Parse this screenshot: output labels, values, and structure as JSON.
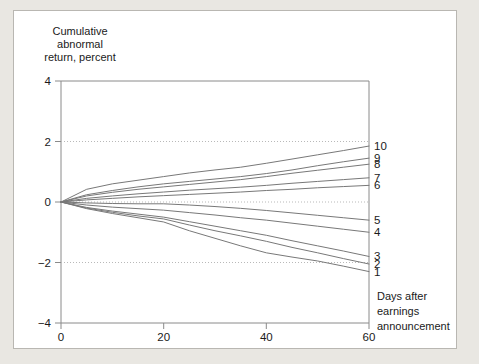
{
  "figure": {
    "background_color": "#ffffff",
    "page_background_color": "#e9e7e2",
    "border_color": "#b9b7b2"
  },
  "chart_data": {
    "type": "line",
    "title": "",
    "ylabel_lines": [
      "Cumulative",
      "abnormal",
      "return, percent"
    ],
    "ylabel": "Cumulative abnormal return, percent",
    "xlabel_lines": [
      "Days after",
      "earnings",
      "announcement"
    ],
    "xlabel": "Days after earnings announcement",
    "xlim": [
      0,
      60
    ],
    "ylim": [
      -4,
      4
    ],
    "xticks": [
      0,
      20,
      40,
      60
    ],
    "xtick_labels": [
      "0",
      "20",
      "40",
      "60"
    ],
    "yticks": [
      4,
      2,
      0,
      -2,
      -4
    ],
    "ytick_labels": [
      "4",
      "2",
      "0",
      "−2",
      "−4"
    ],
    "grid": "horizontal dotted at y = 2, 0, -2",
    "gridlines_y": [
      2,
      0,
      -2
    ],
    "legend_position": "right-of-axes, one label per series at line end",
    "line_color": "#787878",
    "x": [
      0,
      5,
      10,
      15,
      20,
      25,
      30,
      35,
      40,
      45,
      50,
      55,
      60
    ],
    "series": [
      {
        "name": "10",
        "label": "10",
        "end_value": 1.85,
        "values": [
          0,
          0.42,
          0.6,
          0.72,
          0.84,
          0.96,
          1.06,
          1.15,
          1.28,
          1.42,
          1.56,
          1.7,
          1.85
        ]
      },
      {
        "name": "9",
        "label": "9",
        "end_value": 1.45,
        "values": [
          0,
          0.24,
          0.38,
          0.5,
          0.6,
          0.68,
          0.76,
          0.84,
          0.94,
          1.06,
          1.2,
          1.33,
          1.45
        ]
      },
      {
        "name": "8",
        "label": "8",
        "end_value": 1.25,
        "values": [
          0,
          0.2,
          0.32,
          0.42,
          0.5,
          0.58,
          0.66,
          0.74,
          0.84,
          0.95,
          1.05,
          1.15,
          1.25
        ]
      },
      {
        "name": "7",
        "label": "7",
        "end_value": 0.8,
        "values": [
          0,
          0.12,
          0.2,
          0.27,
          0.33,
          0.39,
          0.44,
          0.49,
          0.55,
          0.62,
          0.68,
          0.74,
          0.8
        ]
      },
      {
        "name": "6",
        "label": "6",
        "end_value": 0.55,
        "values": [
          0,
          0.07,
          0.12,
          0.17,
          0.21,
          0.25,
          0.29,
          0.33,
          0.38,
          0.42,
          0.47,
          0.51,
          0.55
        ]
      },
      {
        "name": "5",
        "label": "5",
        "end_value": -0.6,
        "values": [
          0,
          -0.03,
          -0.05,
          -0.06,
          -0.06,
          -0.1,
          -0.15,
          -0.21,
          -0.28,
          -0.36,
          -0.44,
          -0.52,
          -0.6
        ]
      },
      {
        "name": "4",
        "label": "4",
        "end_value": -1.0,
        "values": [
          0,
          -0.1,
          -0.17,
          -0.22,
          -0.27,
          -0.35,
          -0.43,
          -0.52,
          -0.6,
          -0.7,
          -0.8,
          -0.9,
          -1.0
        ]
      },
      {
        "name": "3",
        "label": "3",
        "end_value": -1.8,
        "values": [
          0,
          -0.18,
          -0.3,
          -0.4,
          -0.5,
          -0.65,
          -0.8,
          -0.95,
          -1.1,
          -1.28,
          -1.45,
          -1.62,
          -1.8
        ]
      },
      {
        "name": "2",
        "label": "2",
        "end_value": -2.05,
        "values": [
          0,
          -0.2,
          -0.34,
          -0.46,
          -0.56,
          -0.76,
          -0.95,
          -1.12,
          -1.3,
          -1.5,
          -1.68,
          -1.87,
          -2.05
        ]
      },
      {
        "name": "1",
        "label": "1",
        "end_value": -2.3,
        "values": [
          0,
          -0.22,
          -0.38,
          -0.52,
          -0.66,
          -0.95,
          -1.2,
          -1.45,
          -1.68,
          -1.82,
          -1.95,
          -2.12,
          -2.3
        ]
      }
    ]
  }
}
